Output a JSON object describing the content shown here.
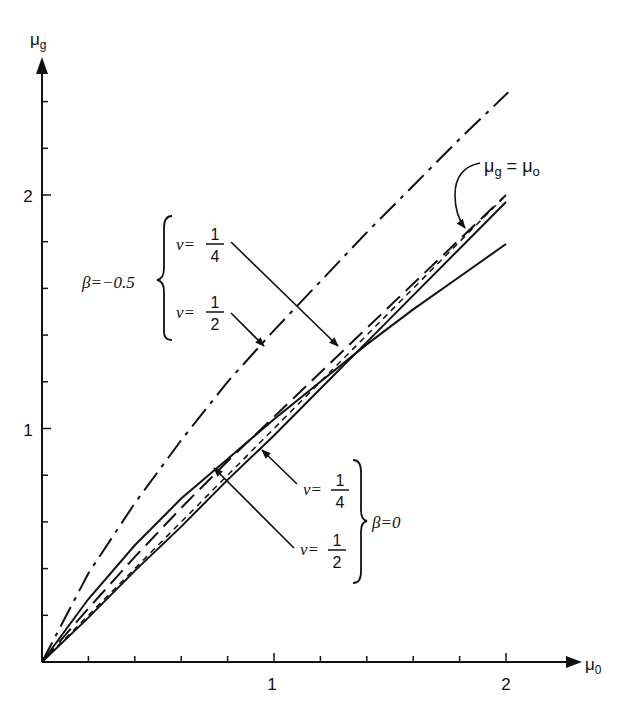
{
  "chart_data": {
    "type": "line",
    "title": "",
    "xlabel": "μo",
    "ylabel": "μg",
    "xlim": [
      0,
      2.3
    ],
    "ylim": [
      0,
      2.6
    ],
    "grid": false,
    "x_ticks": [
      0.2,
      0.4,
      0.6,
      0.8,
      1.0,
      1.2,
      1.4,
      1.6,
      1.8,
      2.0
    ],
    "x_tick_labels": {
      "1": "1",
      "2": "2"
    },
    "y_ticks": [
      0.2,
      0.4,
      0.6,
      0.8,
      1.0,
      1.2,
      1.4,
      1.6,
      1.8,
      2.0,
      2.2,
      2.4
    ],
    "y_tick_labels": {
      "1": "1",
      "2": "2"
    },
    "series": [
      {
        "name": "β=−0.5, ν=1/2",
        "style": "dash-dot",
        "x": [
          0,
          0.2,
          0.4,
          0.6,
          0.8,
          1.0,
          1.2,
          1.4,
          1.6,
          1.8,
          2.01
        ],
        "y": [
          0,
          0.38,
          0.68,
          0.95,
          1.2,
          1.42,
          1.63,
          1.84,
          2.04,
          2.24,
          2.44
        ]
      },
      {
        "name": "β=−0.5, ν=1/4",
        "style": "long-dash",
        "x": [
          0,
          0.2,
          0.4,
          0.6,
          0.8,
          1.0,
          1.2,
          1.4,
          1.6,
          1.8,
          2.0
        ],
        "y": [
          0,
          0.23,
          0.45,
          0.66,
          0.86,
          1.05,
          1.24,
          1.43,
          1.62,
          1.81,
          2.0
        ]
      },
      {
        "name": "β=0, ν=1/4",
        "style": "solid",
        "x": [
          0,
          0.2,
          0.4,
          0.6,
          0.8,
          1.0,
          1.2,
          1.4,
          1.6,
          1.8,
          2.0
        ],
        "y": [
          0,
          0.27,
          0.5,
          0.7,
          0.87,
          1.04,
          1.2,
          1.36,
          1.51,
          1.65,
          1.79
        ]
      },
      {
        "name": "β=0, ν=1/2",
        "style": "solid",
        "x": [
          0,
          0.2,
          0.4,
          0.6,
          0.8,
          1.0,
          1.2,
          1.4,
          1.6,
          1.8,
          2.0
        ],
        "y": [
          0,
          0.19,
          0.39,
          0.58,
          0.78,
          0.97,
          1.17,
          1.37,
          1.57,
          1.77,
          1.97
        ]
      },
      {
        "name": "μg = μo",
        "style": "dashed",
        "x": [
          0,
          2.0
        ],
        "y": [
          0,
          2.0
        ]
      }
    ],
    "annotations": [
      {
        "text": "β=−0.5",
        "group": [
          "ν=1/4",
          "ν=1/2"
        ]
      },
      {
        "text": "β=0",
        "group": [
          "ν=1/4",
          "ν=1/2"
        ]
      },
      {
        "text": "μg = μo",
        "points_to": "identity line near μo≈1.75"
      }
    ]
  },
  "labels": {
    "y_axis": "μ",
    "y_axis_sub": "g",
    "x_axis": "μ",
    "x_axis_sub": "0",
    "tick_1": "1",
    "tick_2": "2",
    "beta_neg": "β=−0.5",
    "beta_zero": "β=0",
    "nu": "ν=",
    "one": "1",
    "four": "4",
    "two": "2",
    "identity_mu": "μ",
    "identity_g": "g",
    "identity_eq": " = ",
    "identity_o": "o"
  }
}
